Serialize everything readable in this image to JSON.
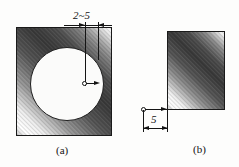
{
  "figure": {
    "background_color": "#fdfdfc",
    "line_color": "#141414",
    "subfigures": [
      {
        "id": "a",
        "caption": "(a)",
        "shape": "square-with-circular-hole",
        "dimension": {
          "label": "2~5",
          "placement": "top",
          "arrow_style": "inward",
          "extension_lines": 2
        },
        "center_marker": {
          "icon": "small-circle-point-marker",
          "leader_arrow": "right"
        }
      },
      {
        "id": "b",
        "caption": "(b)",
        "shape": "square",
        "dimension": {
          "label": "5",
          "placement": "bottom-left",
          "arrow_style": "outward",
          "extension_lines": 2
        },
        "origin_marker": {
          "icon": "small-circle-point-marker",
          "leader_arrow": "right"
        }
      }
    ]
  }
}
